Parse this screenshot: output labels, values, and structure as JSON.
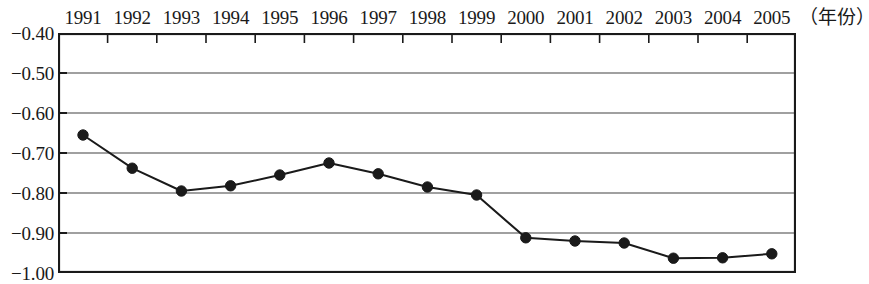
{
  "chart_data": {
    "type": "line",
    "title": "",
    "xlabel": "（年份）",
    "ylabel": "",
    "categories": [
      "1991",
      "1992",
      "1993",
      "1994",
      "1995",
      "1996",
      "1997",
      "1998",
      "1999",
      "2000",
      "2001",
      "2002",
      "2003",
      "2004",
      "2005"
    ],
    "values": [
      -0.655,
      -0.738,
      -0.795,
      -0.782,
      -0.755,
      -0.725,
      -0.752,
      -0.785,
      -0.805,
      -0.912,
      -0.92,
      -0.925,
      -0.963,
      -0.962,
      -0.952
    ],
    "series": [
      {
        "name": "",
        "values": [
          -0.655,
          -0.738,
          -0.795,
          -0.782,
          -0.755,
          -0.725,
          -0.752,
          -0.785,
          -0.805,
          -0.912,
          -0.92,
          -0.925,
          -0.963,
          -0.962,
          -0.952
        ]
      }
    ],
    "ylim": [
      -1.0,
      -0.4
    ],
    "ytick_labels": [
      "−0.40",
      "−0.50",
      "−0.60",
      "−0.70",
      "−0.80",
      "−0.90",
      "−1.00"
    ],
    "ytick_values": [
      -0.4,
      -0.5,
      -0.6,
      -0.7,
      -0.8,
      -0.9,
      -1.0
    ],
    "grid": true,
    "grid_axis": "y",
    "legend": "none",
    "x_axis_position": "top",
    "marker": "filled-circle",
    "line_color": "#1a1a1a",
    "marker_color": "#1a1a1a",
    "grid_color": "#808080",
    "frame_color": "#1a1a1a",
    "background": "#ffffff"
  }
}
